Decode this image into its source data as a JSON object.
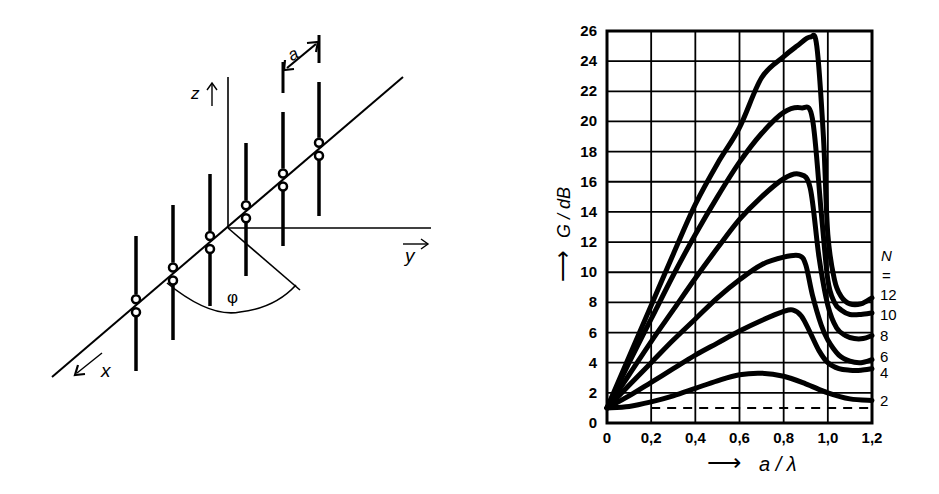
{
  "diagram": {
    "axes": {
      "x_label": "x",
      "y_label": "y",
      "z_label": "z"
    },
    "spacing_label": "a",
    "angle_label": "φ",
    "dipole_count": 6
  },
  "chart_data": {
    "type": "line",
    "title": "",
    "xlabel": "a / λ",
    "ylabel": "G / dB",
    "x_arrow": "⟶",
    "y_arrow": "⟶",
    "xlim": [
      0,
      1.2
    ],
    "ylim": [
      0,
      26
    ],
    "grid": true,
    "x_ticks": [
      "0",
      "0,2",
      "0,4",
      "0,6",
      "0,8",
      "1,0",
      "1,2"
    ],
    "y_ticks": [
      "0",
      "2",
      "4",
      "6",
      "8",
      "10",
      "12",
      "14",
      "16",
      "18",
      "20",
      "22",
      "24",
      "26"
    ],
    "legend_title": "N",
    "legend_eq": "=",
    "legend_position": "right",
    "reference_line": {
      "style": "dashed",
      "y": 1.0,
      "x_from": 0.2,
      "x_to": 1.2
    },
    "series": [
      {
        "name": "12",
        "x": [
          0,
          0.1,
          0.2,
          0.3,
          0.4,
          0.5,
          0.6,
          0.7,
          0.8,
          0.86,
          0.92,
          0.95,
          0.98,
          1.0,
          1.03,
          1.06,
          1.1,
          1.15,
          1.2
        ],
        "values": [
          1.0,
          4.4,
          7.8,
          11.2,
          14.5,
          17.2,
          19.6,
          22.9,
          24.3,
          25.0,
          25.6,
          25.0,
          19.0,
          12.5,
          9.5,
          8.4,
          7.9,
          7.9,
          8.3
        ]
      },
      {
        "name": "10",
        "x": [
          0,
          0.1,
          0.2,
          0.3,
          0.4,
          0.5,
          0.6,
          0.7,
          0.8,
          0.88,
          0.93,
          0.97,
          1.0,
          1.03,
          1.06,
          1.1,
          1.15,
          1.2
        ],
        "values": [
          1.0,
          4.0,
          6.9,
          9.8,
          12.5,
          15.0,
          17.3,
          19.2,
          20.6,
          20.9,
          20.2,
          14.0,
          9.5,
          8.0,
          7.5,
          7.2,
          7.2,
          7.3
        ]
      },
      {
        "name": "8",
        "x": [
          0,
          0.1,
          0.2,
          0.3,
          0.4,
          0.5,
          0.6,
          0.7,
          0.8,
          0.87,
          0.92,
          0.96,
          1.0,
          1.04,
          1.08,
          1.12,
          1.16,
          1.2
        ],
        "values": [
          1.0,
          3.2,
          5.4,
          7.5,
          9.6,
          11.6,
          13.5,
          15.0,
          16.2,
          16.5,
          15.6,
          11.0,
          7.8,
          6.3,
          5.8,
          5.6,
          5.6,
          5.8
        ]
      },
      {
        "name": "6",
        "x": [
          0,
          0.1,
          0.2,
          0.3,
          0.4,
          0.5,
          0.6,
          0.7,
          0.8,
          0.87,
          0.9,
          0.93,
          0.97,
          1.0,
          1.05,
          1.1,
          1.15,
          1.2
        ],
        "values": [
          1.0,
          2.5,
          4.0,
          5.5,
          6.9,
          8.3,
          9.5,
          10.5,
          11.0,
          11.1,
          10.5,
          8.5,
          6.5,
          5.5,
          4.5,
          4.1,
          4.0,
          4.2
        ]
      },
      {
        "name": "4",
        "x": [
          0,
          0.1,
          0.2,
          0.3,
          0.4,
          0.5,
          0.6,
          0.7,
          0.8,
          0.84,
          0.88,
          0.92,
          0.96,
          1.0,
          1.05,
          1.1,
          1.15,
          1.2
        ],
        "values": [
          1.0,
          1.8,
          2.7,
          3.6,
          4.5,
          5.3,
          6.1,
          6.8,
          7.4,
          7.5,
          7.1,
          6.0,
          4.8,
          4.0,
          3.6,
          3.5,
          3.5,
          3.6
        ]
      },
      {
        "name": "2",
        "x": [
          0,
          0.1,
          0.2,
          0.3,
          0.4,
          0.5,
          0.6,
          0.7,
          0.8,
          0.9,
          1.0,
          1.1,
          1.2
        ],
        "values": [
          1.0,
          1.1,
          1.4,
          1.8,
          2.3,
          2.8,
          3.2,
          3.3,
          3.1,
          2.6,
          2.0,
          1.6,
          1.5
        ]
      }
    ]
  }
}
